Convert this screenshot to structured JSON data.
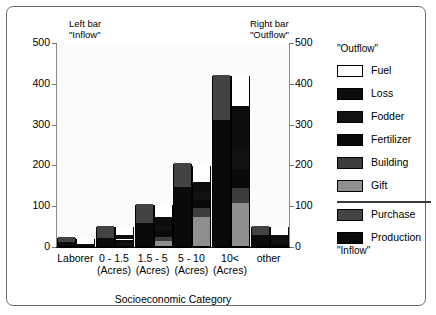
{
  "annotations": {
    "left_note_line1": "Left bar",
    "left_note_line2": "\"Inflow\"",
    "right_note_line1": "Right bar",
    "right_note_line2": "\"Outflow\"",
    "units": "GJ/Household/Yr"
  },
  "legend": {
    "header": "\"Outflow\"",
    "footer": "\"Inflow\"",
    "items": [
      {
        "label": "Fuel",
        "color": "#ffffff"
      },
      {
        "label": "Loss",
        "color": "#0d0d0d"
      },
      {
        "label": "Fodder",
        "color": "#111111"
      },
      {
        "label": "Fertilizer",
        "color": "#0a0a0a"
      },
      {
        "label": "Building",
        "color": "#3d3d3d"
      },
      {
        "label": "Gift",
        "color": "#8f8f8f"
      },
      {
        "label": "Purchase",
        "color": "#434343"
      },
      {
        "label": "Production",
        "color": "#0a0a0a"
      }
    ]
  },
  "chart_data": {
    "type": "bar",
    "title": "",
    "subtitle": "GJ/Household/Yr",
    "xlabel": "Socioeconomic Category",
    "ylabel": "",
    "ylim": [
      0,
      500
    ],
    "yticks": [
      0,
      100,
      200,
      300,
      400,
      500
    ],
    "ytick_labels_left": [
      "0",
      "100",
      "200",
      "300",
      "400",
      "500"
    ],
    "ytick_labels_right": [
      "0",
      "100",
      "200",
      "300",
      "400",
      "500"
    ],
    "grid": false,
    "legend_position": "right",
    "categories": [
      "Laborer",
      "0 - 1.5",
      "1.5 - 5",
      "5 - 10",
      "10<",
      "other"
    ],
    "category_sublabels": [
      "",
      "(Acres)",
      "(Acres)",
      "(Acres)",
      "(Acres)",
      ""
    ],
    "bar_pairs": [
      {
        "name": "Inflow",
        "note": "left bar of each pair"
      },
      {
        "name": "Outflow",
        "note": "right bar of each pair"
      }
    ],
    "series": [
      {
        "name": "Inflow - Purchase",
        "values": [
          12,
          30,
          45,
          58,
          110,
          22
        ]
      },
      {
        "name": "Inflow - Production",
        "values": [
          10,
          20,
          57,
          145,
          310,
          28
        ]
      },
      {
        "name": "Outflow - Gift",
        "values": [
          0,
          0,
          12,
          70,
          105,
          0
        ]
      },
      {
        "name": "Outflow - Building",
        "values": [
          0,
          0,
          10,
          22,
          38,
          0
        ]
      },
      {
        "name": "Outflow - Fertilizer",
        "values": [
          0,
          8,
          14,
          20,
          45,
          6
        ]
      },
      {
        "name": "Outflow - Fodder",
        "values": [
          0,
          8,
          14,
          20,
          55,
          8
        ]
      },
      {
        "name": "Outflow - Loss",
        "values": [
          6,
          12,
          20,
          25,
          100,
          14
        ]
      },
      {
        "name": "Outflow - Fuel",
        "values": [
          14,
          22,
          32,
          42,
          77,
          22
        ]
      }
    ],
    "totals": {
      "inflow": [
        22,
        50,
        102,
        203,
        420,
        50
      ],
      "outflow": [
        20,
        50,
        102,
        199,
        420,
        50
      ]
    }
  },
  "bars": [
    {
      "category": "Laborer",
      "inflow": [
        {
          "name": "Production",
          "color": "#0a0a0a",
          "value": 10
        },
        {
          "name": "Purchase",
          "color": "#434343",
          "value": 12
        }
      ],
      "outflow": [
        {
          "name": "Loss",
          "color": "#0d0d0d",
          "value": 6
        },
        {
          "name": "Fuel",
          "color": "#ffffff",
          "value": 14
        }
      ]
    },
    {
      "category": "0 - 1.5",
      "inflow": [
        {
          "name": "Production",
          "color": "#0a0a0a",
          "value": 20
        },
        {
          "name": "Purchase",
          "color": "#434343",
          "value": 30
        }
      ],
      "outflow": [
        {
          "name": "Fodder",
          "color": "#111111",
          "value": 8
        },
        {
          "name": "Fertilizer",
          "color": "#0a0a0a",
          "value": 8
        },
        {
          "name": "Loss",
          "color": "#0d0d0d",
          "value": 12
        },
        {
          "name": "Fuel",
          "color": "#ffffff",
          "value": 22
        }
      ]
    },
    {
      "category": "1.5 - 5",
      "inflow": [
        {
          "name": "Production",
          "color": "#0a0a0a",
          "value": 57
        },
        {
          "name": "Purchase",
          "color": "#434343",
          "value": 45
        }
      ],
      "outflow": [
        {
          "name": "Gift",
          "color": "#8f8f8f",
          "value": 12
        },
        {
          "name": "Building",
          "color": "#3d3d3d",
          "value": 10
        },
        {
          "name": "Fertilizer",
          "color": "#0a0a0a",
          "value": 14
        },
        {
          "name": "Fodder",
          "color": "#111111",
          "value": 14
        },
        {
          "name": "Loss",
          "color": "#0d0d0d",
          "value": 20
        },
        {
          "name": "Fuel",
          "color": "#ffffff",
          "value": 32
        }
      ]
    },
    {
      "category": "5 - 10",
      "inflow": [
        {
          "name": "Production",
          "color": "#0a0a0a",
          "value": 145
        },
        {
          "name": "Purchase",
          "color": "#434343",
          "value": 58
        }
      ],
      "outflow": [
        {
          "name": "Gift",
          "color": "#8f8f8f",
          "value": 70
        },
        {
          "name": "Building",
          "color": "#3d3d3d",
          "value": 22
        },
        {
          "name": "Fertilizer",
          "color": "#0a0a0a",
          "value": 20
        },
        {
          "name": "Fodder",
          "color": "#111111",
          "value": 20
        },
        {
          "name": "Loss",
          "color": "#0d0d0d",
          "value": 25
        },
        {
          "name": "Fuel",
          "color": "#ffffff",
          "value": 42
        }
      ]
    },
    {
      "category": "10<",
      "inflow": [
        {
          "name": "Production",
          "color": "#0a0a0a",
          "value": 310
        },
        {
          "name": "Purchase",
          "color": "#434343",
          "value": 110
        }
      ],
      "outflow": [
        {
          "name": "Gift",
          "color": "#8f8f8f",
          "value": 105
        },
        {
          "name": "Building",
          "color": "#3d3d3d",
          "value": 38
        },
        {
          "name": "Fertilizer",
          "color": "#0a0a0a",
          "value": 45
        },
        {
          "name": "Fodder",
          "color": "#111111",
          "value": 55
        },
        {
          "name": "Loss",
          "color": "#0d0d0d",
          "value": 100
        },
        {
          "name": "Fuel",
          "color": "#ffffff",
          "value": 77
        }
      ]
    },
    {
      "category": "other",
      "inflow": [
        {
          "name": "Production",
          "color": "#0a0a0a",
          "value": 28
        },
        {
          "name": "Purchase",
          "color": "#434343",
          "value": 22
        }
      ],
      "outflow": [
        {
          "name": "Fertilizer",
          "color": "#0a0a0a",
          "value": 6
        },
        {
          "name": "Fodder",
          "color": "#111111",
          "value": 8
        },
        {
          "name": "Loss",
          "color": "#0d0d0d",
          "value": 14
        },
        {
          "name": "Fuel",
          "color": "#ffffff",
          "value": 22
        }
      ]
    }
  ]
}
